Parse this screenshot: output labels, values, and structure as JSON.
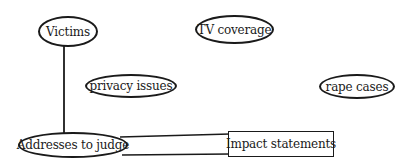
{
  "diagram": {
    "type": "concept-map",
    "nodes": [
      {
        "id": "victims",
        "label": "Victims",
        "shape": "oval"
      },
      {
        "id": "tv_coverage",
        "label": "TV coverage",
        "shape": "oval"
      },
      {
        "id": "privacy_issues",
        "label": "privacy issues",
        "shape": "oval"
      },
      {
        "id": "rape_cases",
        "label": "rape cases",
        "shape": "oval"
      },
      {
        "id": "addresses_to_judge",
        "label": "Addresses to judge",
        "shape": "oval"
      },
      {
        "id": "impact_statements",
        "label": "Impact statements",
        "shape": "rectangle"
      }
    ],
    "edges": [
      {
        "from": "victims",
        "to": "addresses_to_judge"
      },
      {
        "from": "addresses_to_judge",
        "to": "impact_statements"
      }
    ],
    "colors": {
      "stroke": "#1a1a1a",
      "background": "#ffffff"
    }
  }
}
